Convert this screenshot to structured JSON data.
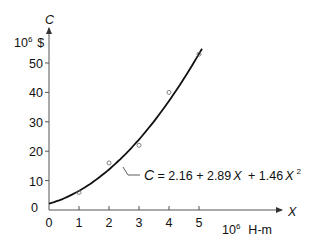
{
  "chart_data": {
    "type": "scatter",
    "title": "",
    "xlabel": "X",
    "xunit_prefix": "10",
    "xunit_exp": "6",
    "xunit": "H-m",
    "ylabel": "C",
    "yunit_prefix": "10",
    "yunit_exp": "6",
    "yunit": "$",
    "x_ticks": [
      "0",
      "1",
      "2",
      "3",
      "4",
      "5"
    ],
    "y_ticks": [
      "0",
      "10",
      "20",
      "30",
      "40",
      "50"
    ],
    "xlim": [
      0,
      5.9
    ],
    "ylim": [
      0,
      58
    ],
    "grid": false,
    "series": [
      {
        "name": "observed",
        "type": "scatter",
        "marker": "open-circle",
        "x": [
          1,
          2,
          3,
          4,
          5
        ],
        "y": [
          6,
          16,
          22,
          40,
          53
        ]
      },
      {
        "name": "fit",
        "type": "line",
        "equation": "C = 2.16 + 2.89X + 1.46X^2",
        "coefficients": {
          "a": 2.16,
          "b": 2.89,
          "c": 1.46
        },
        "x_range": [
          0,
          5.1
        ]
      }
    ],
    "annotation": {
      "text_C": "C",
      "text_eq1": " = 2.16 + 2.89",
      "text_X1": "X",
      "text_eq2": " + 1.46",
      "text_X2": "X",
      "text_exp": "2"
    }
  }
}
